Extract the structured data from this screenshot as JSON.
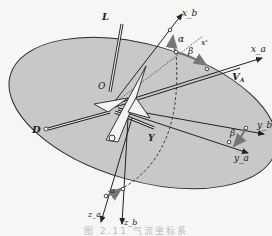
{
  "diagram": {
    "type": "coordinate-system",
    "origin_label": "O",
    "axes": {
      "xa": "x_a",
      "ya": "y_a",
      "za": "z_a",
      "xb": "x_b",
      "yb": "y_b",
      "zb": "z_b",
      "xprime": "x'"
    },
    "vectors": {
      "lift": "L",
      "drag": "D",
      "side_force": "Y",
      "velocity": "V",
      "velocity_sub": "A"
    },
    "angles": {
      "alpha_top": "α",
      "beta_top": "β",
      "beta_right": "β",
      "alpha_bottom": "α"
    },
    "colors": {
      "plane_fill": "#c8c8c8",
      "line": "#2a2a2a",
      "arc_arrow": "#888888",
      "background": "#f7f6f4"
    }
  },
  "caption": "图 2.11  气流坐标系"
}
